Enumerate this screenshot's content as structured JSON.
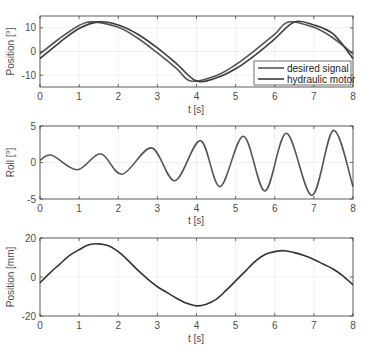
{
  "chart_data": [
    {
      "type": "line",
      "title": "",
      "xlabel": "t [s]",
      "ylabel": "Position [°]",
      "xlim": [
        0,
        8
      ],
      "ylim": [
        -15,
        15
      ],
      "xticks": [
        0,
        1,
        2,
        3,
        4,
        5,
        6,
        7,
        8
      ],
      "yticks": [
        -10,
        0,
        10
      ],
      "grid": true,
      "legend_position": "lower right",
      "series": [
        {
          "name": "desired signal",
          "color": "#555555",
          "amplitude": 12.5,
          "period": 5.0,
          "peak_t": 1.35,
          "x": [
            0,
            0.5,
            1,
            1.35,
            2,
            2.5,
            3,
            3.5,
            3.85,
            4.5,
            5,
            5.5,
            6,
            6.35,
            7,
            7.5,
            8
          ],
          "y": [
            -1,
            5.5,
            11,
            12.5,
            10.2,
            5.6,
            -0.6,
            -7.3,
            -12.5,
            -10.2,
            -5.6,
            0.6,
            7.3,
            12.5,
            10.2,
            5.6,
            -1
          ]
        },
        {
          "name": "hydraulic motor",
          "color": "#3c3c3c",
          "amplitude": 12.5,
          "period": 5.0,
          "peak_t": 1.5,
          "x": [
            0,
            0.5,
            1,
            1.5,
            2,
            2.5,
            3,
            3.5,
            4,
            4.5,
            5,
            5.5,
            6,
            6.5,
            7,
            7.5,
            8
          ],
          "y": [
            -3,
            3.8,
            9.7,
            12.5,
            11.2,
            7.3,
            1.5,
            -5.3,
            -12.5,
            -11.2,
            -7.3,
            -1.5,
            5.3,
            12.5,
            11.2,
            7.3,
            -3
          ]
        }
      ]
    },
    {
      "type": "line",
      "title": "",
      "xlabel": "t [s]",
      "ylabel": "Roll [°]",
      "xlim": [
        0,
        8
      ],
      "ylim": [
        -5,
        5
      ],
      "xticks": [
        0,
        1,
        2,
        3,
        4,
        5,
        6,
        7,
        8
      ],
      "yticks": [
        -5,
        0,
        5
      ],
      "grid": true,
      "series": [
        {
          "name": "roll",
          "color": "#555555",
          "x": [
            0,
            0.3,
            0.95,
            1.55,
            2.1,
            2.85,
            3.45,
            4.1,
            4.6,
            5.2,
            5.75,
            6.3,
            6.95,
            7.5,
            8
          ],
          "y": [
            0.3,
            1.0,
            -1.0,
            1.2,
            -1.6,
            2.0,
            -2.5,
            3.0,
            -3.3,
            3.6,
            -3.9,
            4.0,
            -4.5,
            4.4,
            -3.3
          ]
        }
      ]
    },
    {
      "type": "line",
      "title": "",
      "xlabel": "t [s]",
      "ylabel": "Position [mm]",
      "xlim": [
        0,
        8
      ],
      "ylim": [
        -20,
        20
      ],
      "xticks": [
        0,
        1,
        2,
        3,
        4,
        5,
        6,
        7,
        8
      ],
      "yticks": [
        -20,
        0,
        20
      ],
      "grid": true,
      "series": [
        {
          "name": "position",
          "color": "#333333",
          "x": [
            0,
            0.25,
            0.5,
            0.75,
            1,
            1.25,
            1.5,
            1.75,
            2,
            2.25,
            2.5,
            2.75,
            3,
            3.25,
            3.5,
            3.75,
            4,
            4.25,
            4.5,
            4.75,
            5,
            5.25,
            5.5,
            5.75,
            6,
            6.25,
            6.5,
            6.75,
            7,
            7.25,
            7.5,
            7.75,
            8
          ],
          "y": [
            -3,
            2,
            6.5,
            11,
            14,
            16.5,
            17,
            16,
            13,
            8.5,
            3.5,
            -1,
            -5,
            -8,
            -11,
            -13.5,
            -14.8,
            -14,
            -11.5,
            -7,
            -2,
            3,
            8,
            11.5,
            13,
            13.5,
            12.5,
            11,
            9,
            6.5,
            4,
            0.5,
            -4
          ]
        }
      ]
    }
  ],
  "plots": [
    {
      "ylabel": "Position [°]",
      "xlabel": "t [s]",
      "yticks": [
        "10",
        "0",
        "-10"
      ],
      "xticks": [
        "0",
        "1",
        "2",
        "3",
        "4",
        "5",
        "6",
        "7",
        "8"
      ],
      "legend": [
        "desired signal",
        "hydraulic motor"
      ]
    },
    {
      "ylabel": "Roll [°]",
      "xlabel": "t [s]",
      "yticks": [
        "5",
        "0",
        "-5"
      ],
      "xticks": [
        "0",
        "1",
        "2",
        "3",
        "4",
        "5",
        "6",
        "7",
        "8"
      ]
    },
    {
      "ylabel": "Position [mm]",
      "xlabel": "t [s]",
      "yticks": [
        "20",
        "0",
        "-20"
      ],
      "xticks": [
        "0",
        "1",
        "2",
        "3",
        "4",
        "5",
        "6",
        "7",
        "8"
      ]
    }
  ]
}
